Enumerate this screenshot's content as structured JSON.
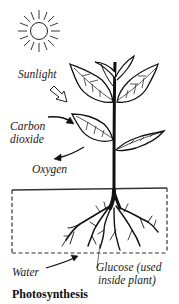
{
  "diagram": {
    "title": "Photosynthesis",
    "labels": {
      "sunlight": "Sunlight",
      "carbon_dioxide_line1": "Carbon",
      "carbon_dioxide_line2": "dioxide",
      "oxygen": "Oxygen",
      "water": "Water",
      "glucose_line1": "Glucose (used",
      "glucose_line2": "inside plant)"
    },
    "elements": [
      "sun-icon",
      "plant-illustration",
      "roots",
      "soil-box-dashed",
      "arrows"
    ],
    "colors": {
      "ink": "#111111",
      "background": "#ffffff"
    }
  }
}
